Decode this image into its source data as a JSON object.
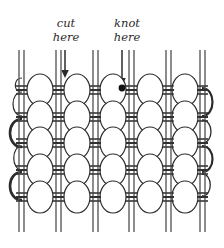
{
  "diagram": {
    "background_color": "#ffffff",
    "ink_color": "#2b2b2b",
    "warp_color": "#6e6e6e",
    "weft_color": "#333333",
    "knot_marker_color": "#111111",
    "annotations": [
      {
        "id": "cut",
        "line1": "cut",
        "line2": "here",
        "text_x": 66,
        "text_y": 24,
        "arrow_x": 65,
        "arrow_y_top": 50,
        "arrow_y_bottom": 76
      },
      {
        "id": "knot",
        "line1": "knot",
        "line2": "here",
        "text_x": 127,
        "text_y": 24,
        "arrow_x": 122,
        "arrow_y_top": 50,
        "arrow_y_bottom": 84
      }
    ],
    "warp_pairs_x": [
      21,
      58,
      95,
      131,
      168,
      202,
      213
    ],
    "warp_pair_gap": 5,
    "warp_y_top": 50,
    "warp_y_bottom": 232,
    "weft_rows_y": [
      90,
      117,
      143,
      170,
      197
    ],
    "knot_columns_x": [
      40,
      77,
      113,
      150,
      185
    ],
    "knot_rx": 13,
    "knot_ry": 16,
    "knot_rows": 5,
    "knot_columns": 5,
    "knot_marker": {
      "x": 122,
      "y": 88,
      "r": 3.4
    },
    "left_loops_y": [
      104,
      130,
      157,
      184
    ],
    "right_loops_y": [
      104,
      130,
      157,
      184
    ],
    "counts": {
      "warp_pairs": 7,
      "weft_rows": 5,
      "knot_total": 25
    }
  }
}
